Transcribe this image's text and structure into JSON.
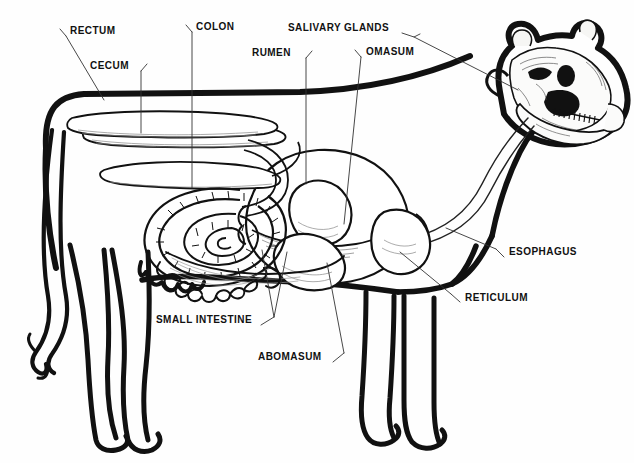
{
  "diagram": {
    "style": "black-and-white line drawing",
    "ink_color": "#111111",
    "background_color": "#fefefe",
    "leader_line_color": "#333333"
  },
  "labels": [
    {
      "id": "rectum",
      "text": "RECTUM",
      "x": 70,
      "y": 31,
      "tick": "left-down",
      "leader": "M66,36 L62,29 M66,36 L103,99"
    },
    {
      "id": "cecum",
      "text": "CECUM",
      "x": 90,
      "y": 66,
      "tick": "right-down",
      "leader": "M137,71 L141,64 M141,71 L141,132"
    },
    {
      "id": "colon",
      "text": "COLON",
      "x": 196,
      "y": 27,
      "tick": "left-down",
      "leader": "M192,32 L188,25 M192,32 L192,186"
    },
    {
      "id": "rumen",
      "text": "RUMEN",
      "x": 252,
      "y": 53,
      "tick": "right-down",
      "leader": "M302,58 L306,51 M306,58 L306,182"
    },
    {
      "id": "salivary_glands",
      "text": "SALIVARY GLANDS",
      "x": 288,
      "y": 28,
      "tick": "right-line",
      "leader": "M402,33 L418,38 L516,88"
    },
    {
      "id": "omasum",
      "text": "OMASUM",
      "x": 365,
      "y": 52,
      "tick": "left-down",
      "leader": "M361,57 L357,50 M361,57 L345,222"
    },
    {
      "id": "esophagus",
      "text": "ESOPHAGUS",
      "x": 508,
      "y": 252,
      "tick": "left-up",
      "leader": "M504,257 L497,250 M497,250 L447,228"
    },
    {
      "id": "reticulum",
      "text": "RETICULUM",
      "x": 464,
      "y": 298,
      "tick": "left-up",
      "leader": "M460,302 L452,295 M452,295 L401,251"
    },
    {
      "id": "small_intestine",
      "text": "SMALL INTESTINE",
      "x": 156,
      "y": 320,
      "tick": "right-up",
      "leader": "M260,325 L274,318 M274,318 L262,250 M274,318 L286,252"
    },
    {
      "id": "abomasum",
      "text": "ABOMASUM",
      "x": 258,
      "y": 357,
      "tick": "right-up",
      "leader": "M331,362 L343,354 M343,354 L326,262"
    }
  ],
  "organs": [
    {
      "id": "rectum",
      "name": "Rectum"
    },
    {
      "id": "cecum",
      "name": "Cecum"
    },
    {
      "id": "colon",
      "name": "Colon (spiral colon)"
    },
    {
      "id": "rumen",
      "name": "Rumen"
    },
    {
      "id": "reticulum",
      "name": "Reticulum"
    },
    {
      "id": "omasum",
      "name": "Omasum"
    },
    {
      "id": "abomasum",
      "name": "Abomasum"
    },
    {
      "id": "small_intestine",
      "name": "Small intestine"
    },
    {
      "id": "esophagus",
      "name": "Esophagus"
    },
    {
      "id": "salivary_glands",
      "name": "Salivary glands"
    }
  ],
  "figure_parts": [
    {
      "id": "body_outline",
      "name": "cow body outline"
    },
    {
      "id": "skull",
      "name": "cow skull with teeth"
    },
    {
      "id": "tail",
      "name": "tail"
    },
    {
      "id": "hind_legs",
      "name": "hind legs"
    },
    {
      "id": "fore_legs",
      "name": "fore legs"
    },
    {
      "id": "udder",
      "name": "udder"
    }
  ]
}
